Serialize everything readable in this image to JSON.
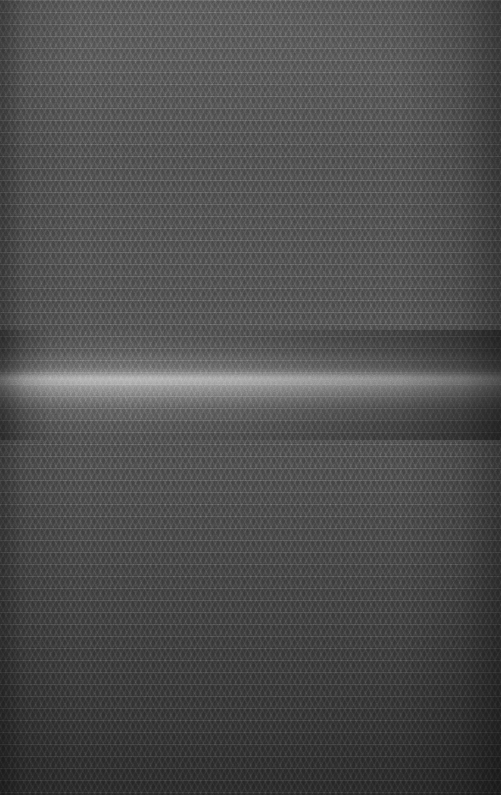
{
  "image": {
    "kind": "natural-image",
    "subject": "macro-photograph-of-dark-woven-fabric-mesh",
    "caption": "",
    "width": 501,
    "height": 795,
    "orientation": "portrait",
    "has_text": false,
    "has_ui_controls": false,
    "palette": {
      "base_gray": "#4a4a4a",
      "shadow_gray": "#363636",
      "midtone_gray": "#4e4e4e",
      "highlight_gray": "#9a9a9a",
      "darkest_edge": "#303030",
      "canvas_background": "#2b2b2b"
    },
    "texture": {
      "pattern": "diamond-lattice-weave",
      "cell_width_px": 10,
      "cell_height_px": 12,
      "weft_row_pitch_px": 12,
      "diagonal_angle_deg": 62,
      "thread_direction": "bidirectional-crosshatch"
    },
    "lighting": {
      "specular_band_top_px": 365,
      "specular_band_bottom_px": 400,
      "specular_band_center_px": 380,
      "specular_core_top_px": 372,
      "specular_core_height_px": 14,
      "brightest_horizontal_position": "left-of-center",
      "secondary_sheen": "upper-region",
      "vignette": "edges-and-bottom-darkened"
    }
  }
}
